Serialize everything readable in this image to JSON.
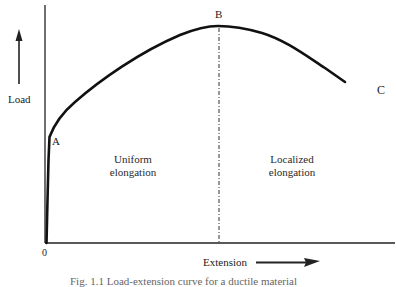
{
  "diagram": {
    "type": "load-extension curve",
    "axes": {
      "x_label": "Extension",
      "y_label": "Load",
      "origin_label": "0"
    },
    "points": {
      "A": "A",
      "B": "B",
      "C": "C"
    },
    "regions": {
      "left_line1": "Uniform",
      "left_line2": "elongation",
      "right_line1": "Localized",
      "right_line2": "elongation"
    },
    "caption": "Fig. 1.1   Load-extension curve for a ductile material"
  },
  "colors": {
    "ink": "#111111",
    "background": "#ffffff"
  }
}
